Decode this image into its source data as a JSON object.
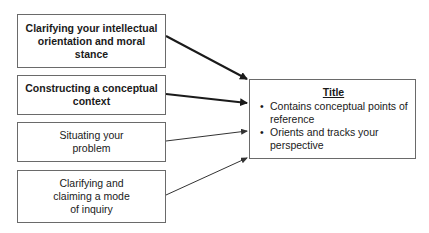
{
  "diagram": {
    "inputs": [
      {
        "label": "Clarifying your intellectual orientation and moral stance",
        "emphasis": "bold"
      },
      {
        "label": "Constructing a conceptual context",
        "emphasis": "bold"
      },
      {
        "label": "Situating your problem",
        "emphasis": "normal"
      },
      {
        "label": "Clarifying and claiming a mode of inquiry",
        "emphasis": "normal"
      }
    ],
    "target": {
      "title": "Title",
      "bullets": [
        "Contains conceptual points of reference",
        "Orients and tracks your perspective"
      ]
    },
    "colors": {
      "border": "#6a6a6a",
      "arrow": "#1a1a1a",
      "text": "#1a1a1a"
    }
  }
}
